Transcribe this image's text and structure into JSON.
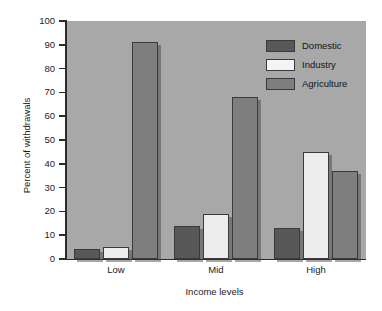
{
  "chart_data": {
    "type": "bar",
    "title": "",
    "subtitle": "",
    "xlabel": "Income levels",
    "ylabel": "Percent of withdrawals",
    "categories": [
      "Low",
      "Mid",
      "High"
    ],
    "series": [
      {
        "name": "Domestic",
        "color": "#585858",
        "values": [
          4,
          14,
          13
        ]
      },
      {
        "name": "Industry",
        "color": "#ededed",
        "values": [
          5,
          19,
          45
        ]
      },
      {
        "name": "Agriculture",
        "color": "#7e7e7e",
        "values": [
          91,
          68,
          37
        ]
      }
    ],
    "ylim": [
      0,
      100
    ],
    "yticks": [
      0,
      10,
      20,
      30,
      40,
      50,
      60,
      70,
      80,
      90,
      100
    ],
    "ytick_labels": [
      "0",
      "10",
      "20",
      "30",
      "40",
      "50",
      "60",
      "70",
      "80",
      "90",
      "100"
    ],
    "grid": false,
    "legend_position": "top-right",
    "plot_background": "#a8a8a8",
    "figure_background": "#ffffff",
    "axis_color": "#2b2b2b"
  },
  "legend": {
    "items": [
      {
        "label": "Domestic"
      },
      {
        "label": "Industry"
      },
      {
        "label": "Agriculture"
      }
    ]
  }
}
